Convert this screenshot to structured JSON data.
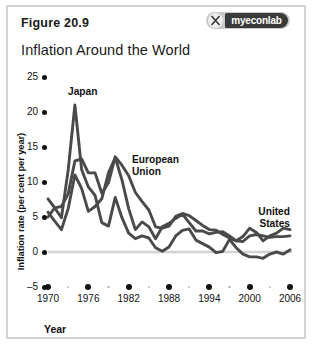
{
  "figure": {
    "label": "Figure 20.9",
    "title": "Inflation Around the World"
  },
  "logo": {
    "name": "myeconlab-logo",
    "wordmark": "myeconlab",
    "mark_icon": "x-mark-icon"
  },
  "chart_data": {
    "type": "line",
    "title": "Inflation Around the World",
    "xlabel": "Year",
    "ylabel": "Inflation rate (per cent per year)",
    "xlim": [
      1970,
      2006
    ],
    "ylim": [
      -5,
      25
    ],
    "xticks": [
      1970,
      1976,
      1982,
      1988,
      1994,
      2000,
      2006
    ],
    "xticks_minor": [
      1973,
      1979,
      1985,
      1991,
      1997,
      2003
    ],
    "yticks": [
      25,
      20,
      15,
      10,
      5,
      0,
      -5
    ],
    "grid": false,
    "legend": "inline-annotations",
    "zero_line": true,
    "x": [
      1970,
      1971,
      1972,
      1973,
      1974,
      1975,
      1976,
      1977,
      1978,
      1979,
      1980,
      1981,
      1982,
      1983,
      1984,
      1985,
      1986,
      1987,
      1988,
      1989,
      1990,
      1991,
      1992,
      1993,
      1994,
      1995,
      1996,
      1997,
      1998,
      1999,
      2000,
      2001,
      2002,
      2003,
      2004,
      2005,
      2006
    ],
    "series": [
      {
        "name": "Japan",
        "color": "#4a4a4a",
        "label_position": "above-1974-peak",
        "values": [
          7.6,
          6.3,
          4.9,
          11.7,
          21.0,
          11.8,
          9.3,
          8.1,
          4.2,
          3.7,
          7.8,
          4.9,
          2.7,
          1.9,
          2.3,
          2.0,
          0.6,
          0.1,
          0.7,
          2.3,
          3.1,
          3.3,
          1.7,
          1.2,
          0.7,
          -0.1,
          0.1,
          1.8,
          0.6,
          -0.3,
          -0.7,
          -0.7,
          -0.9,
          -0.3,
          0.0,
          -0.3,
          0.3
        ]
      },
      {
        "name": "European Union",
        "color": "#4a4a4a",
        "label_position": "right-of-1980-peak",
        "values": [
          5.0,
          6.3,
          6.5,
          8.3,
          13.0,
          13.3,
          11.3,
          11.3,
          8.4,
          9.9,
          13.6,
          12.4,
          10.9,
          8.5,
          7.2,
          6.0,
          3.6,
          3.4,
          3.7,
          5.1,
          5.5,
          5.2,
          4.5,
          3.8,
          3.2,
          3.1,
          2.5,
          2.0,
          1.6,
          1.5,
          2.3,
          2.5,
          2.3,
          2.1,
          2.2,
          2.2,
          2.3
        ]
      },
      {
        "name": "United States",
        "color": "#4a4a4a",
        "label_position": "upper-right",
        "values": [
          5.7,
          4.4,
          3.2,
          6.2,
          11.0,
          9.1,
          5.8,
          6.5,
          7.6,
          11.3,
          13.5,
          10.3,
          6.2,
          3.2,
          4.3,
          3.6,
          1.9,
          3.6,
          4.1,
          4.8,
          5.4,
          4.2,
          3.0,
          3.0,
          2.6,
          2.8,
          2.9,
          2.3,
          1.6,
          2.2,
          3.4,
          2.8,
          1.6,
          2.3,
          2.7,
          3.4,
          3.2
        ]
      }
    ],
    "annotations": [
      {
        "text": "Japan",
        "series": "Japan"
      },
      {
        "text": "European\nUnion",
        "series": "European Union",
        "line1": "European",
        "line2": "Union"
      },
      {
        "text": "United\nStates",
        "series": "United States",
        "line1": "United",
        "line2": "States"
      }
    ]
  }
}
